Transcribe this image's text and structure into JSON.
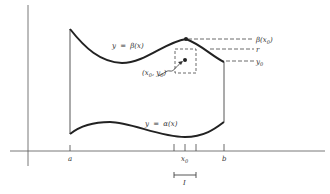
{
  "diagram": {
    "curves": {
      "upper": {
        "label_y": "y",
        "label_eq": "=",
        "label_fn": "β(x)"
      },
      "lower": {
        "label_y": "y",
        "label_eq": "=",
        "label_fn": "α(x)"
      }
    },
    "right_labels": {
      "beta_x0": "β(x",
      "beta_x0_sub": "0",
      "beta_x0_close": ")",
      "r": "r",
      "y0": "y",
      "y0_sub": "0"
    },
    "point_label": {
      "open": "(x",
      "sub_x": "0",
      "mid": ", y",
      "sub_y": "0",
      "close": ")"
    },
    "x_axis_labels": {
      "a": "a",
      "b": "b",
      "x0": "x",
      "x0_sub": "0",
      "interval": "I"
    },
    "colors": {
      "stroke": "#2a2a2a",
      "text": "#333333",
      "background": "#ffffff"
    }
  }
}
